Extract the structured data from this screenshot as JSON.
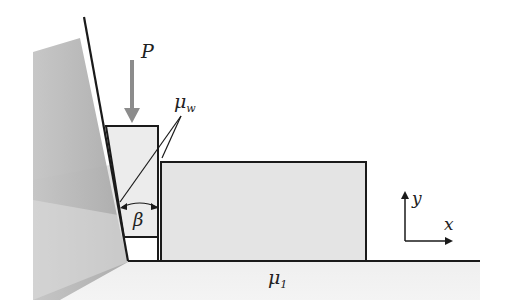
{
  "diagram": {
    "labels": {
      "force": "P",
      "wall_friction": {
        "symbol": "μ",
        "subscript": "w"
      },
      "angle": "β",
      "floor_friction": {
        "symbol": "μ",
        "subscript": "1"
      },
      "axis_x": "x",
      "axis_y": "y"
    },
    "colors": {
      "line": "#1a1a1a",
      "wall_fill": "#b8b8b8",
      "ground_fill": "#e6e6e6",
      "wedge_fill": "#ececec",
      "block_fill": "#e4e4e4",
      "arrow": "#8c8c8c"
    }
  }
}
